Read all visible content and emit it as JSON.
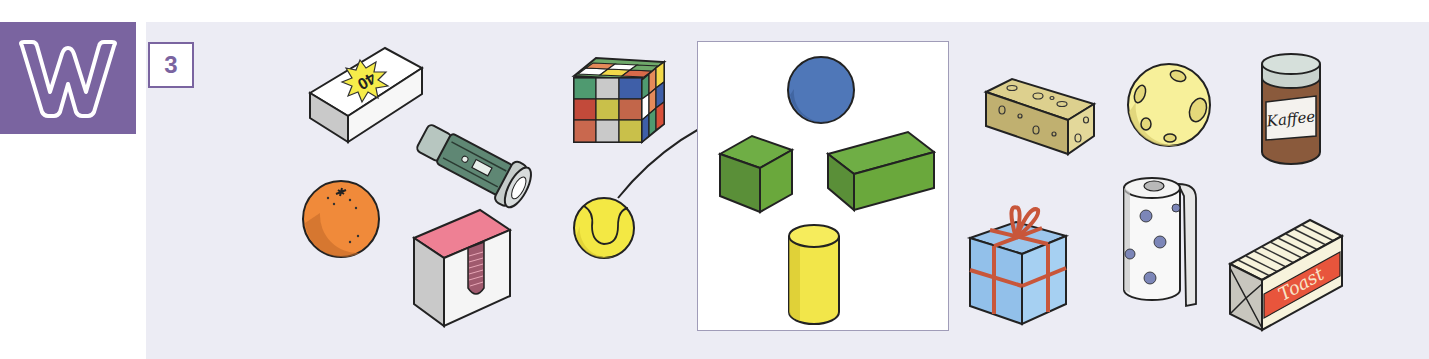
{
  "badge": {
    "letter": "W",
    "color": "#7a64a0"
  },
  "exercise": {
    "number": "3"
  },
  "panel": {
    "background": "#ececf4"
  },
  "items": [
    {
      "id": "matchbox",
      "label": "Streichholzschachtel",
      "text": "40"
    },
    {
      "id": "flashlight",
      "label": "Taschenlampe"
    },
    {
      "id": "orange",
      "label": "Orange"
    },
    {
      "id": "sticky-note-cube",
      "label": "Zettelbox"
    },
    {
      "id": "rubiks-cube",
      "label": "Zauberwürfel"
    },
    {
      "id": "tennis-ball",
      "label": "Tennisball"
    },
    {
      "id": "sponge",
      "label": "Schwamm"
    },
    {
      "id": "ball",
      "label": "Ball"
    },
    {
      "id": "coffee-jar",
      "label": "Kaffeedose",
      "text": "Kaffee"
    },
    {
      "id": "gift-box",
      "label": "Geschenk"
    },
    {
      "id": "paper-towel-roll",
      "label": "Küchenrolle"
    },
    {
      "id": "toast-bread",
      "label": "Toastbrot",
      "text": "Toast"
    }
  ],
  "shapes_frame": {
    "shapes": [
      {
        "id": "sphere",
        "label": "Kugel",
        "color": "#4f77b8"
      },
      {
        "id": "cube",
        "label": "Würfel",
        "color": "#6aa83c"
      },
      {
        "id": "cuboid",
        "label": "Quader",
        "color": "#6aa83c"
      },
      {
        "id": "cylinder",
        "label": "Zylinder",
        "color": "#f2e64a"
      }
    ]
  },
  "example_connection": {
    "from": "tennis-ball",
    "to": "sphere"
  }
}
